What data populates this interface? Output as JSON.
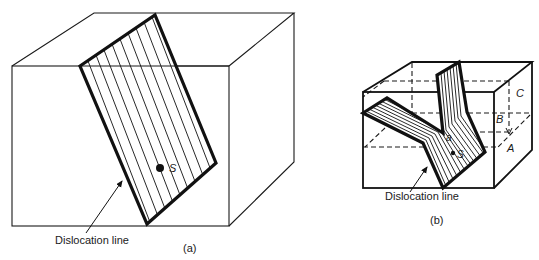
{
  "figure_a": {
    "caption": "(a)",
    "dislocation_label": "Dislocation line",
    "point_label": "S"
  },
  "figure_b": {
    "caption": "(b)",
    "dislocation_label": "Dislocation line",
    "point_labels": {
      "s": "S",
      "a": "a"
    },
    "layer_labels": {
      "a": "A",
      "b": "B",
      "c": "C"
    }
  },
  "colors": {
    "line": "#1a1a1a",
    "background": "#ffffff"
  }
}
